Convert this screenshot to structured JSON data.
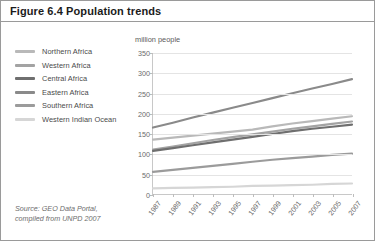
{
  "figure": {
    "title": "Figure 6.4 Population trends"
  },
  "source": {
    "line1": "Source: GEO Data Portal,",
    "line2": "compiled from UNPD 2007"
  },
  "legend": {
    "items": [
      {
        "label": "Northern Africa",
        "color": "#b9b9b9"
      },
      {
        "label": "Western Africa",
        "color": "#a3a3a3"
      },
      {
        "label": "Central Africa",
        "color": "#6f6f6f"
      },
      {
        "label": "Eastern Africa",
        "color": "#8a8a8a"
      },
      {
        "label": "Southern Africa",
        "color": "#9b9b9b"
      },
      {
        "label": "Western Indian Ocean",
        "color": "#d6d6d6"
      }
    ]
  },
  "chart_data": {
    "type": "line",
    "title": "Figure 6.4 Population trends",
    "xlabel": "",
    "ylabel": "million people",
    "ylim": [
      0,
      350
    ],
    "yticks": [
      0,
      50,
      100,
      150,
      200,
      250,
      300,
      350
    ],
    "grid": true,
    "legend_position": "left",
    "x": [
      1987,
      1989,
      1991,
      1993,
      1995,
      1997,
      1999,
      2001,
      2003,
      2005,
      2007
    ],
    "xticks": [
      "1987",
      "1989",
      "1991",
      "1993",
      "1995",
      "1997",
      "1999",
      "2001",
      "2003",
      "2005",
      "2007"
    ],
    "series": [
      {
        "name": "Northern Africa",
        "color": "#b9b9b9",
        "values": [
          135,
          140,
          145,
          150,
          155,
          160,
          168,
          175,
          181,
          187,
          193
        ]
      },
      {
        "name": "Western Africa",
        "color": "#a3a3a3",
        "values": [
          110,
          118,
          126,
          134,
          141,
          148,
          155,
          162,
          168,
          174,
          180
        ]
      },
      {
        "name": "Central Africa",
        "color": "#6f6f6f",
        "values": [
          107,
          114,
          121,
          128,
          135,
          142,
          149,
          156,
          162,
          167,
          172
        ]
      },
      {
        "name": "Eastern Africa",
        "color": "#8a8a8a",
        "values": [
          165,
          177,
          190,
          202,
          214,
          226,
          238,
          250,
          262,
          273,
          285
        ]
      },
      {
        "name": "Southern Africa",
        "color": "#9b9b9b",
        "values": [
          55,
          60,
          65,
          70,
          75,
          80,
          85,
          89,
          93,
          97,
          100
        ]
      },
      {
        "name": "Western Indian Ocean",
        "color": "#d6d6d6",
        "values": [
          14,
          15,
          16,
          17,
          18,
          20,
          21,
          22,
          23,
          25,
          26
        ]
      }
    ]
  }
}
